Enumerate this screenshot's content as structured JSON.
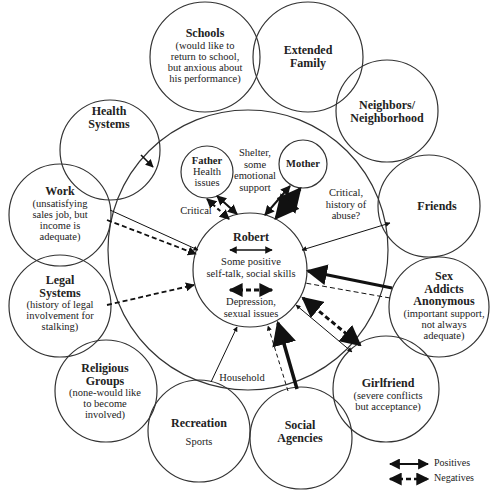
{
  "diagram": {
    "type": "ecomap",
    "center": {
      "name": "Robert",
      "positive_note": "Some positive self-talk, social skills",
      "positive_lines": [
        "Some positive",
        "self-talk, social skills"
      ],
      "negative_lines": [
        "Depression,",
        "sexual issues"
      ]
    },
    "household": {
      "label": "Household",
      "father": {
        "name": "Father",
        "lines": [
          "Health",
          "issues"
        ]
      },
      "mother": {
        "name": "Mother"
      },
      "shelter_note": [
        "Shelter,",
        "some",
        "emotional",
        "support"
      ],
      "critical_father": "Critical",
      "critical_mother": [
        "Critical,",
        "history of",
        "abuse?"
      ]
    },
    "systems": [
      {
        "id": "schools",
        "title": [
          "Schools"
        ],
        "note": [
          "(would like to",
          "return to school,",
          "but anxious about",
          "his performance)"
        ]
      },
      {
        "id": "extended-family",
        "title": [
          "Extended",
          "Family"
        ],
        "note": []
      },
      {
        "id": "neighbors",
        "title": [
          "Neighbors/",
          "Neighborhood"
        ],
        "note": []
      },
      {
        "id": "friends",
        "title": [
          "Friends"
        ],
        "note": []
      },
      {
        "id": "sex-addicts-anonymous",
        "title": [
          "Sex",
          "Addicts",
          "Anonymous"
        ],
        "note": [
          "(important support,",
          "not always",
          "adequate)"
        ]
      },
      {
        "id": "girlfriend",
        "title": [
          "Girlfriend"
        ],
        "note": [
          "(severe conflicts",
          "but acceptance)"
        ]
      },
      {
        "id": "social-agencies",
        "title": [
          "Social",
          "Agencies"
        ],
        "note": []
      },
      {
        "id": "recreation",
        "title": [
          "Recreation"
        ],
        "note": [
          "Sports"
        ]
      },
      {
        "id": "religious-groups",
        "title": [
          "Religious",
          "Groups"
        ],
        "note": [
          "(none-would like",
          "to become",
          "involved)"
        ]
      },
      {
        "id": "legal-systems",
        "title": [
          "Legal",
          "Systems"
        ],
        "note": [
          "(history of legal",
          "involvement for",
          "stalking)"
        ]
      },
      {
        "id": "work",
        "title": [
          "Work"
        ],
        "note": [
          "(unsatisfying",
          "sales job, but",
          "income is",
          "adequate)"
        ]
      },
      {
        "id": "health-systems",
        "title": [
          "Health",
          "Systems"
        ],
        "note": []
      }
    ],
    "legend": {
      "positives": "Positives",
      "negatives": "Negatives"
    }
  }
}
